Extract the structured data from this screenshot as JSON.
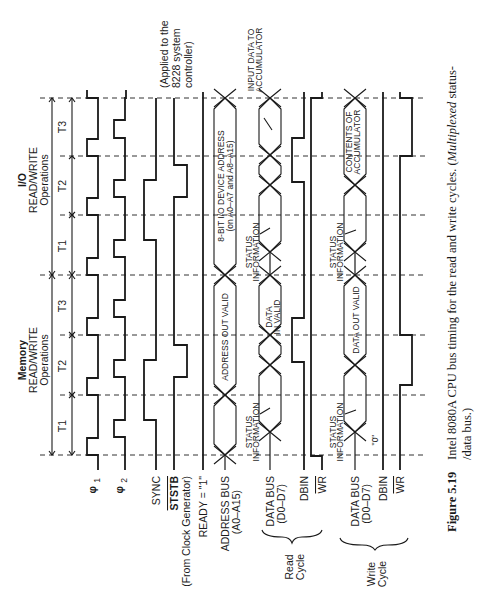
{
  "figure": {
    "number": "Figure 5.19",
    "caption_line1": "Intel 8080A CPU bus timing for the read and write cycles. (",
    "caption_italic": "Multiplexed",
    "caption_line1_end": " status-",
    "caption_line2": "/data bus.)"
  },
  "phases": {
    "memory": {
      "title1": "Memory",
      "title2": "READ/WRITE",
      "title3": "Operations",
      "states": [
        "T1",
        "T2",
        "T3"
      ]
    },
    "io": {
      "title1": "I/O",
      "title2": "READ/WRITE",
      "title3": "Operations",
      "states": [
        "T1",
        "T2",
        "T3"
      ]
    }
  },
  "signals": {
    "phi1": "φ",
    "phi1_sub": "1",
    "phi2": "φ",
    "phi2_sub": "2",
    "sync": "SYNC",
    "ststb": "STSTB",
    "ststb_note": "(From Clock Generator)",
    "ststb_applied1": "(Applied to the",
    "ststb_applied2": "8228 system",
    "ststb_applied3": "controller)",
    "ready": "READY = \"1\"",
    "address_bus1": "ADDRESS BUS",
    "address_bus2": "(A0–A15)",
    "read_data_bus1": "DATA BUS",
    "read_data_bus2": "(D0–D7)",
    "read_dbin": "DBIN",
    "read_wr": "WR",
    "write_data_bus1": "DATA BUS",
    "write_data_bus2": "(D0–D7)",
    "write_dbin": "DBIN",
    "write_wr": "WR",
    "write_dbin_level": "\"0\""
  },
  "groups": {
    "read1": "Read",
    "read2": "Cycle",
    "write1": "Write",
    "write2": "Cycle"
  },
  "bus_labels": {
    "address_out_valid": "ADDRESS OUT VALID",
    "io_addr1": "8-BIT I/O DEVICE ADDRESS",
    "io_addr2": "(on A0–A7  and A8–A15)",
    "status1": "STATUS",
    "status2": "INFORMATION",
    "data_in1": "DATA",
    "data_in2": "IN VALID",
    "input_acc1": "INPUT DATA TO",
    "input_acc2": "ACCUMULATOR",
    "data_out_valid": "DATA OUT VALID",
    "contents1": "CONTENTS OF",
    "contents2": "ACCUMULATOR"
  }
}
